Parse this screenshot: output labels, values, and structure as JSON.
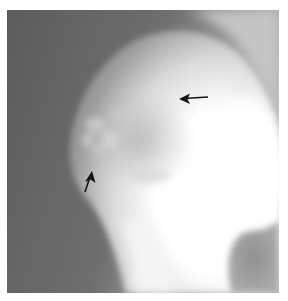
{
  "image": {
    "kind": "radiograph",
    "description": "Grayscale X-ray with a large bright (radiopaque) rounded mass occupying the right and lower portion, with mottled trabecular-like detail at its upper-left margin, against a darker gray background.",
    "colors": {
      "background_border": "#ffffff",
      "dark_field": "#5f5f5f",
      "mid_field": "#8a8a8a",
      "bright_mass": "#ffffff",
      "lower_right_blob": "#9a9a9a",
      "arrow": "#141414"
    }
  },
  "annotations": [
    {
      "id": "arrow-upper-right",
      "direction": "left",
      "tip": [
        180,
        99
      ],
      "tail": [
        208,
        97
      ]
    },
    {
      "id": "arrow-lower-left",
      "direction": "up",
      "tip": [
        92,
        172
      ],
      "tail": [
        85,
        192
      ]
    }
  ]
}
